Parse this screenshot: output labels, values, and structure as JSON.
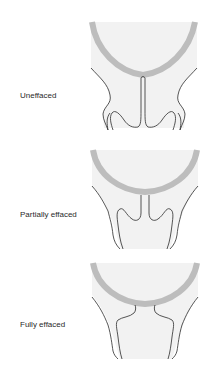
{
  "colors": {
    "background": "#ffffff",
    "fetal_head_arc": "#bdbdbd",
    "tissue_fill": "#f2f2f2",
    "outline": "#2b2b2b",
    "label_text": "#2a2a2a"
  },
  "stages": [
    {
      "label": "Uneffaced",
      "description": "long, closed cervical canal with narrow central channel"
    },
    {
      "label": "Partially effaced",
      "description": "shortened cervix, canal opening widened"
    },
    {
      "label": "Fully effaced",
      "description": "cervix thinned, canal merged into lower uterine segment"
    }
  ]
}
